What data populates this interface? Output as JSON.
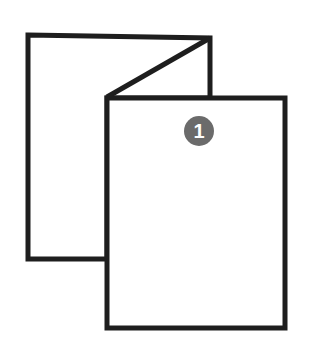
{
  "diagram": {
    "back_panel": {
      "label": ""
    },
    "front_panel": {
      "badge": {
        "number": "1",
        "color": "#6b6b6b",
        "text_color": "#ffffff"
      }
    },
    "stroke_color": "#1e1e1e"
  }
}
